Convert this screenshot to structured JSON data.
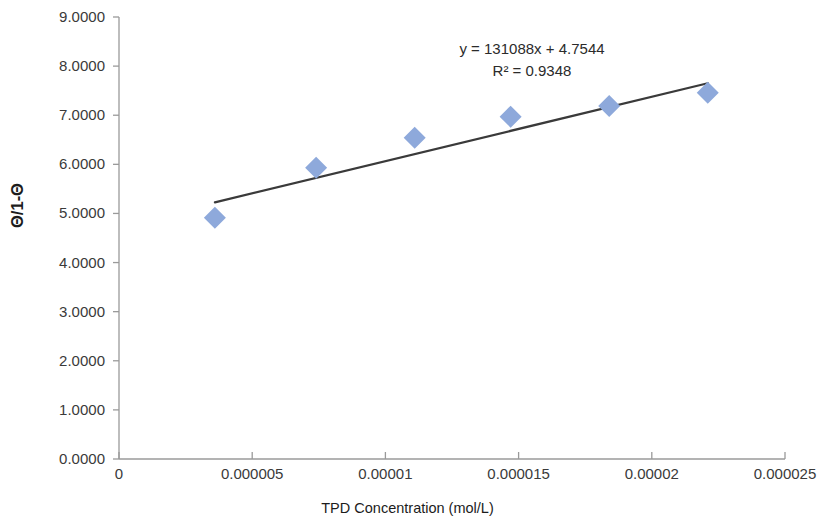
{
  "chart_data": {
    "type": "scatter",
    "title": "",
    "xlabel": "TPD Concentration (mol/L)",
    "ylabel": "Θ/1-Θ",
    "xlim": [
      0,
      2.5e-05
    ],
    "ylim": [
      0,
      9.0
    ],
    "grid": false,
    "legend": "none",
    "marker": {
      "shape": "diamond",
      "color": "#8EA9DB",
      "size": 11
    },
    "trendline": {
      "color": "#3A3A3A",
      "equation": "y = 131088x + 4.7544",
      "r_squared_label": "R² = 0.9348",
      "slope": 131088,
      "intercept": 4.7544,
      "r_squared": 0.9348,
      "x_start": 3.6e-06,
      "x_end": 2.21e-05
    },
    "x": [
      3.6e-06,
      7.4e-06,
      1.11e-05,
      1.47e-05,
      1.84e-05,
      2.21e-05
    ],
    "y": [
      4.91,
      5.93,
      6.54,
      6.97,
      7.19,
      7.46
    ],
    "series": [
      {
        "name": "TPD adsorption",
        "points": [
          {
            "x": 3.6e-06,
            "y": 4.91
          },
          {
            "x": 7.4e-06,
            "y": 5.93
          },
          {
            "x": 1.11e-05,
            "y": 6.54
          },
          {
            "x": 1.47e-05,
            "y": 6.97
          },
          {
            "x": 1.84e-05,
            "y": 7.19
          },
          {
            "x": 2.21e-05,
            "y": 7.46
          }
        ]
      }
    ],
    "x_tick_labels": [
      "0",
      "0.000005",
      "0.00001",
      "0.000015",
      "0.00002",
      "0.000025"
    ],
    "x_tick_values": [
      0,
      5e-06,
      1e-05,
      1.5e-05,
      2e-05,
      2.5e-05
    ],
    "y_tick_labels": [
      "0.0000",
      "1.0000",
      "2.0000",
      "3.0000",
      "4.0000",
      "5.0000",
      "6.0000",
      "7.0000",
      "8.0000",
      "9.0000"
    ],
    "y_tick_values": [
      0,
      1,
      2,
      3,
      4,
      5,
      6,
      7,
      8,
      9
    ],
    "annotations": [
      "y = 131088x + 4.7544",
      "R² = 0.9348"
    ]
  },
  "axes": {
    "y_title": "Θ/1-Θ",
    "x_title": "TPD Concentration (mol/L)",
    "axis_color": "#9a9a9a"
  },
  "annotation": {
    "line1": "y = 131088x + 4.7544",
    "line2": "R² = 0.9348"
  }
}
